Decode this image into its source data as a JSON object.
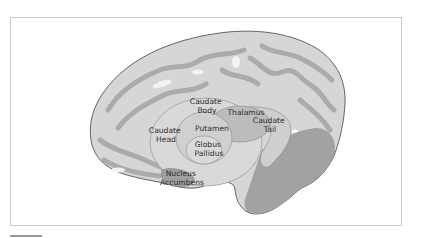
{
  "figure": {
    "labels": {
      "caudate_body": [
        "Caudate",
        "Body"
      ],
      "thalamus": [
        "Thalamus"
      ],
      "caudate_tail": [
        "Caudate",
        "Tail"
      ],
      "caudate_head": [
        "Caudate",
        "Head"
      ],
      "putamen": [
        "Putamen"
      ],
      "globus_pallidus": [
        "Globus",
        "Pallidus"
      ],
      "nucleus_accumbens": [
        "Nucleus",
        "Accumbens"
      ]
    },
    "colors": {
      "cortex_light": "#d8d8d8",
      "sulci": "#a9a9a9",
      "white_matter": "#f2f2f2",
      "brainstem": "#9e9e9e",
      "basal_ganglia": "#cfcfcf",
      "thalamus": "#bdbdbd",
      "outline": "#555555"
    }
  }
}
